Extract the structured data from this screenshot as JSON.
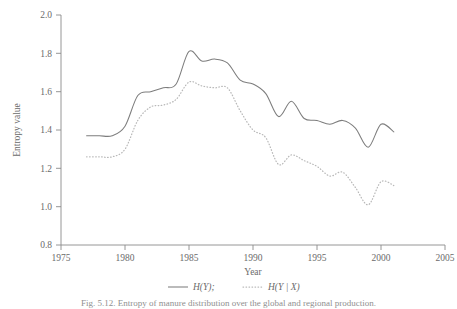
{
  "figure": {
    "caption": "Fig. 5.12.  Entropy of manure distribution over the global and regional production.",
    "ylabel": "Entropy value",
    "xlabel": "Year"
  },
  "legend": {
    "position": "bottom-center",
    "entries": [
      {
        "label": "H(Y);",
        "style": "solid",
        "color": "#7d7d7d",
        "name": "entropy-of-y"
      },
      {
        "label": "H(Y | X)",
        "style": "dotted",
        "color": "#b9b9b9",
        "name": "conditional-entropy-y-given-x"
      }
    ]
  },
  "axes": {
    "x_ticks": [
      "1975",
      "1980",
      "1985",
      "1990",
      "1995",
      "2000",
      "2005"
    ],
    "y_ticks": [
      "0.8",
      "1.0",
      "1.2",
      "1.4",
      "1.6",
      "1.8",
      "2.0"
    ]
  },
  "chart_data": {
    "type": "line",
    "title": "",
    "xlabel": "Year",
    "ylabel": "Entropy value",
    "xlim": [
      1975,
      2005
    ],
    "ylim": [
      0.8,
      2.0
    ],
    "xticks": [
      1975,
      1980,
      1985,
      1990,
      1995,
      2000,
      2005
    ],
    "yticks": [
      0.8,
      1.0,
      1.2,
      1.4,
      1.6,
      1.8,
      2.0
    ],
    "grid": false,
    "legend_position": "bottom-center",
    "x": [
      1977,
      1978,
      1979,
      1980,
      1981,
      1982,
      1983,
      1984,
      1985,
      1986,
      1987,
      1988,
      1989,
      1990,
      1991,
      1992,
      1993,
      1994,
      1995,
      1996,
      1997,
      1998,
      1999,
      2000,
      2001
    ],
    "series": [
      {
        "name": "H(Y);",
        "style": "solid",
        "color": "#7d7d7d",
        "values": [
          1.37,
          1.37,
          1.37,
          1.42,
          1.58,
          1.6,
          1.62,
          1.64,
          1.81,
          1.76,
          1.77,
          1.75,
          1.66,
          1.64,
          1.59,
          1.47,
          1.55,
          1.46,
          1.45,
          1.43,
          1.45,
          1.41,
          1.31,
          1.43,
          1.39
        ]
      },
      {
        "name": "H(Y | X)",
        "style": "dotted",
        "color": "#b9b9b9",
        "values": [
          1.26,
          1.26,
          1.26,
          1.3,
          1.45,
          1.52,
          1.53,
          1.56,
          1.65,
          1.63,
          1.62,
          1.62,
          1.5,
          1.4,
          1.36,
          1.22,
          1.27,
          1.24,
          1.21,
          1.16,
          1.18,
          1.1,
          1.01,
          1.13,
          1.11
        ]
      }
    ]
  },
  "plot_geometry": {
    "left_px": 61,
    "right_px": 445,
    "top_px": 15,
    "bottom_px": 245
  }
}
